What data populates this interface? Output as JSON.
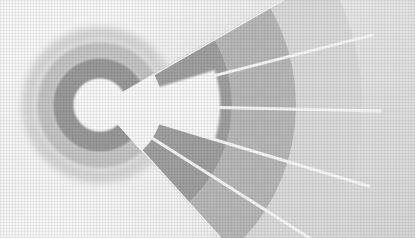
{
  "figure": {
    "title": "Radial sunburst diagram",
    "alt_text": "Grayscale polar diagram: concentric donut rings at left with a white wedge gap, and a fan of five radial sectors expanding to the right.",
    "background_color": "#e9e9e9",
    "background_highlight_color": "#fdfdfd",
    "separator_color": "#ffffff",
    "width": 415,
    "height": 238
  },
  "chart_data": {
    "type": "pie",
    "title": "Radial sunburst diagram",
    "subtitle": "",
    "xlabel": "",
    "ylabel": "",
    "legend_position": "none",
    "grid": false,
    "center": {
      "x": 100,
      "y": 105
    },
    "inner_hole_radius": 26,
    "ring_count": 3,
    "rings": [
      {
        "name": "inner-ring",
        "r_inner": 26,
        "r_outer": 47,
        "color": "#9b9b9b",
        "label": "inner band"
      },
      {
        "name": "middle-ring",
        "r_inner": 47,
        "r_outer": 63,
        "color": "#c9c9c9",
        "label": "middle band"
      },
      {
        "name": "outer-ring",
        "r_inner": 63,
        "r_outer": 78,
        "color": "#dedede",
        "label": "outer halo band"
      }
    ],
    "gap_wedge": {
      "name": "white-wedge-gap",
      "start_angle_deg": -22,
      "end_angle_deg": 22,
      "color": "#ffffff",
      "label": "wedge gap"
    },
    "fan": {
      "name": "radial-sector-fan",
      "start_angle_deg": -30,
      "end_angle_deg": 48,
      "r_inner": 62,
      "r_outer": 262,
      "sector_count": 5,
      "separator_color": "#ffffff",
      "separator_width": 3,
      "categories": [
        "Sector 1",
        "Sector 2",
        "Sector 3",
        "Sector 4",
        "Sector 5"
      ],
      "values": [
        262,
        262,
        262,
        262,
        262
      ],
      "band_count": 3,
      "bands": [
        {
          "name": "fan-band-inner",
          "r_inner": 62,
          "r_outer": 132,
          "color": "#a2a2a2",
          "label": "inner arc band"
        },
        {
          "name": "fan-band-middle",
          "r_inner": 132,
          "r_outer": 196,
          "color": "#bcbcbc",
          "label": "middle arc band"
        },
        {
          "name": "fan-band-outer",
          "r_inner": 196,
          "r_outer": 262,
          "color": "#e0e0e0",
          "label": "outer arc band"
        }
      ]
    },
    "palette": [
      "#9b9b9b",
      "#a2a2a2",
      "#bcbcbc",
      "#c9c9c9",
      "#dedede",
      "#e0e0e0",
      "#ffffff"
    ],
    "annotations": []
  }
}
